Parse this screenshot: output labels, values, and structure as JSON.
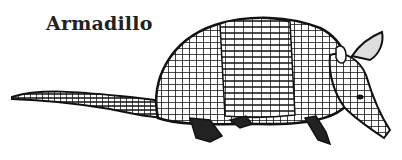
{
  "caption": "Armadillo",
  "illustration": {
    "subject": "armadillo",
    "style": "black-and-white engraving",
    "ink_color": "#111111",
    "background": "#ffffff"
  }
}
